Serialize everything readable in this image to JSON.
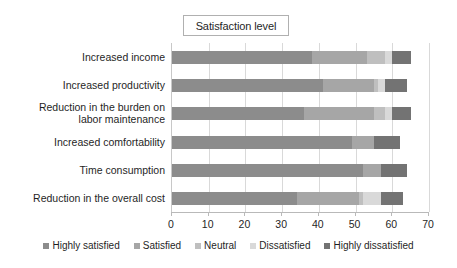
{
  "chart_data": {
    "type": "bar",
    "orientation": "horizontal",
    "stacked": true,
    "title": "Satisfaction level",
    "xlabel": "",
    "ylabel": "",
    "xlim": [
      0,
      70
    ],
    "xticks": [
      0,
      10,
      20,
      30,
      40,
      50,
      60,
      70
    ],
    "grid": true,
    "legend_position": "bottom",
    "categories": [
      "Increased income",
      "Increased productivity",
      "Reduction in the burden on\nlabor maintenance",
      "Increased comfortability",
      "Time consumption",
      "Reduction in the overall cost"
    ],
    "series": [
      {
        "name": "Highly satisfied",
        "color": "#8c8c8c",
        "values": [
          38,
          41,
          36,
          49,
          52,
          34
        ]
      },
      {
        "name": "Satisfied",
        "color": "#a6a6a6",
        "values": [
          15,
          14,
          19,
          6,
          5,
          17
        ]
      },
      {
        "name": "Neutral",
        "color": "#bfbfbf",
        "values": [
          5,
          1,
          3,
          0,
          0,
          1
        ]
      },
      {
        "name": "Dissatisfied",
        "color": "#d9d9d9",
        "values": [
          2,
          2,
          2,
          0,
          0,
          5
        ]
      },
      {
        "name": "Highly dissatisfied",
        "color": "#737373",
        "values": [
          5,
          6,
          5,
          7,
          7,
          6
        ]
      }
    ]
  },
  "legend": {
    "items": [
      {
        "label": "Highly satisfied",
        "color": "#8c8c8c"
      },
      {
        "label": "Satisfied",
        "color": "#a6a6a6"
      },
      {
        "label": "Neutral",
        "color": "#bfbfbf"
      },
      {
        "label": "Dissatisfied",
        "color": "#d9d9d9"
      },
      {
        "label": "Highly dissatisfied",
        "color": "#737373"
      }
    ]
  },
  "axis": {
    "tick_labels": [
      "0",
      "10",
      "20",
      "30",
      "40",
      "50",
      "60",
      "70"
    ]
  }
}
